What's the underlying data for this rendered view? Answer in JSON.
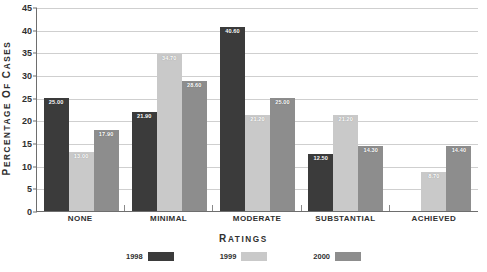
{
  "chart_data": {
    "type": "bar",
    "title": "",
    "xlabel": "Ratings",
    "ylabel": "Percentage of Cases",
    "ylim": [
      0,
      45
    ],
    "ystep": 5,
    "grid": true,
    "legend_position": "bottom",
    "categories": [
      "NONE",
      "MINIMAL",
      "MODERATE",
      "SUBSTANTIAL",
      "ACHIEVED"
    ],
    "ytick_labels": [
      "0",
      "5",
      "10",
      "15",
      "20",
      "25",
      "30",
      "35",
      "40",
      "45"
    ],
    "series": [
      {
        "name": "1998",
        "color": "#3b3b3b",
        "values": [
          25.0,
          21.9,
          40.6,
          12.5,
          0
        ],
        "labels": [
          "25.00",
          "21.90",
          "40.60",
          "12.50",
          ""
        ]
      },
      {
        "name": "1999",
        "color": "#c9c9c9",
        "values": [
          13.0,
          34.7,
          21.2,
          21.2,
          8.7
        ],
        "labels": [
          "13.00",
          "34.70",
          "21.20",
          "21.20",
          "8.70"
        ]
      },
      {
        "name": "2000",
        "color": "#8d8d8d",
        "values": [
          17.9,
          28.6,
          25.0,
          14.3,
          14.4
        ],
        "labels": [
          "17.90",
          "28.60",
          "25.00",
          "14.30",
          "14.40"
        ]
      }
    ]
  },
  "axis": {
    "y_title": "Percentage of Cases",
    "x_title": "Ratings"
  },
  "legend": {
    "items": [
      {
        "label": "1998",
        "color": "#3b3b3b"
      },
      {
        "label": "1999",
        "color": "#c9c9c9"
      },
      {
        "label": "2000",
        "color": "#8d8d8d"
      }
    ]
  }
}
